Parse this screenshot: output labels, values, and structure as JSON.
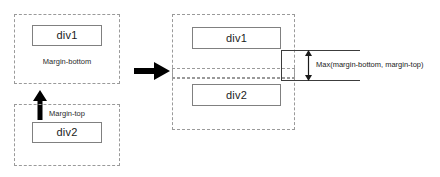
{
  "diagram": {
    "colors": {
      "dashed_border": "#9a9a9a",
      "solid_border": "#808080",
      "arrow_fill": "#000000",
      "dimension_line": "#3c3c3c",
      "text": "#1b1b1b",
      "background": "#ffffff"
    },
    "before": {
      "top_group": {
        "box_label": "div1",
        "margin_label": "Margin-bottom"
      },
      "bottom_group": {
        "box_label": "div2",
        "margin_label": "Margin-top"
      },
      "connector_icon": "arrow-up-icon"
    },
    "transform_icon": "arrow-right-icon",
    "after": {
      "top_box_label": "div1",
      "bottom_box_label": "div2",
      "dimension_label": "Max(margin-bottom, margin-top)",
      "dimension_icon": "double-headed-vertical-arrow-icon"
    }
  }
}
